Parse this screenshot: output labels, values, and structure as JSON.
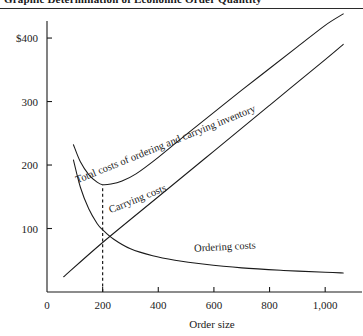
{
  "figure": {
    "title": "Graphic Determination of Economic Order Quantity",
    "title_prefix": "EXHIBIT 4",
    "ink_color": "#1a1a1a",
    "background": "#ffffff"
  },
  "chart_data": {
    "type": "line",
    "title": "Graphic Determination of Economic Order Quantity",
    "xlabel": "Order size",
    "ylabel": "",
    "xlim": [
      0,
      1100
    ],
    "ylim": [
      0,
      430
    ],
    "grid": false,
    "legend_position": "inline-labels",
    "x_ticks": [
      0,
      200,
      400,
      600,
      800,
      1000
    ],
    "x_tick_labels": [
      "0",
      "200",
      "400",
      "600",
      "800",
      "1,000"
    ],
    "y_ticks": [
      0,
      100,
      200,
      300,
      400
    ],
    "y_tick_labels": [
      "0",
      "100",
      "200",
      "300",
      "400"
    ],
    "y_axis_currency_tick": "$400",
    "annotations": [
      {
        "name": "eoq-dashed-line",
        "type": "vertical-dashed",
        "x": 200,
        "y_from": 0,
        "y_to": 168,
        "label": ""
      }
    ],
    "series": [
      {
        "name": "Total costs of ordering and carrying inventory",
        "label": "Total costs of ordering and carrying inventory",
        "label_x": 430,
        "label_y": 228,
        "label_rotation": -22,
        "x": [
          95,
          120,
          150,
          180,
          200,
          230,
          270,
          320,
          400,
          500,
          600,
          700,
          800,
          900,
          1000,
          1065
        ],
        "y": [
          232,
          205,
          185,
          173,
          169,
          170,
          175,
          186,
          212,
          248,
          283,
          318,
          352,
          386,
          420,
          438
        ]
      },
      {
        "name": "Carrying costs",
        "label": "Carrying costs",
        "label_x": 330,
        "label_y": 142,
        "label_rotation": -22,
        "x": [
          60,
          200,
          400,
          600,
          800,
          1000,
          1065
        ],
        "y": [
          24,
          78,
          150,
          222,
          294,
          366,
          390
        ]
      },
      {
        "name": "Ordering costs",
        "label": "Ordering costs",
        "label_x": 640,
        "label_y": 66,
        "label_rotation": -3,
        "x": [
          95,
          120,
          150,
          180,
          200,
          240,
          300,
          380,
          460,
          560,
          700,
          850,
          1000,
          1065
        ],
        "y": [
          208,
          165,
          131,
          108,
          98,
          83,
          68,
          57,
          50,
          44,
          38,
          34,
          31,
          30
        ]
      }
    ]
  }
}
